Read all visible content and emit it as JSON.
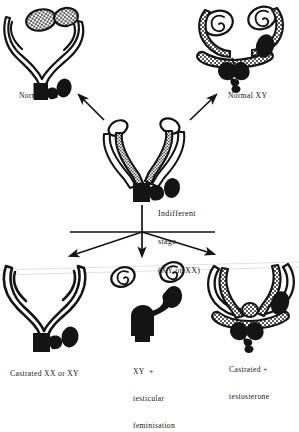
{
  "figure": {
    "title_visible": false,
    "background_color": "#ffffff",
    "ink_color": "#141414"
  },
  "nodes": {
    "center": {
      "id": "indifferent-stage",
      "label_lines": [
        "Indifferent",
        "stage",
        "(XY or XX)"
      ],
      "label_line_1": "Indifferent",
      "label_line_2": "stage",
      "label_line_3": "(XY or XX)",
      "x": 143,
      "y": 160
    },
    "top_left": {
      "id": "normal-xx",
      "label": "Normal XX",
      "x": 62,
      "y": 50
    },
    "top_right": {
      "id": "normal-xy",
      "label": "Normal XY",
      "x": 248,
      "y": 48
    },
    "bottom_left": {
      "id": "castrated-xx-or-xy",
      "label_lines": [
        "Castrated XX or XY"
      ],
      "label_line_1": "Castrated XX or XY",
      "x": 62,
      "y": 305
    },
    "bottom_center": {
      "id": "xy-testicular-feminisation",
      "label_lines": [
        "XY  +",
        "testicular",
        "feminisation"
      ],
      "label_line_1": "XY  +",
      "label_line_2": "testicular",
      "label_line_3": "feminisation",
      "x": 150,
      "y": 305
    },
    "bottom_right": {
      "id": "castrated-plus-testosterone",
      "label_lines": [
        "Castrated +",
        "testosterone"
      ],
      "label_line_1": "Castrated +",
      "label_line_2": "testosterone",
      "x": 248,
      "y": 305
    }
  },
  "arrows": [
    {
      "id": "arrow-to-normal-xx",
      "from": "indifferent-stage",
      "to": "normal-xx",
      "direction": "up-left"
    },
    {
      "id": "arrow-to-normal-xy",
      "from": "indifferent-stage",
      "to": "normal-xy",
      "direction": "up-right"
    },
    {
      "id": "arrow-to-castrated",
      "from": "indifferent-stage",
      "to": "castrated-xx-or-xy",
      "direction": "down-left"
    },
    {
      "id": "arrow-to-testicular-feminisation",
      "from": "indifferent-stage",
      "to": "xy-testicular-feminisation",
      "direction": "down"
    },
    {
      "id": "arrow-to-castrated-testosterone",
      "from": "indifferent-stage",
      "to": "castrated-plus-testosterone",
      "direction": "down-right"
    }
  ]
}
